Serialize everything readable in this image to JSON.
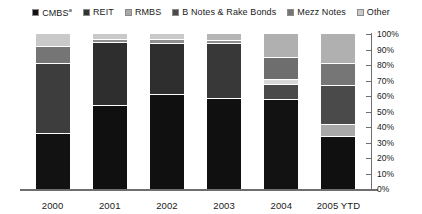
{
  "legend": {
    "position": "top",
    "items": [
      {
        "label": "CMBS",
        "superscript": "a",
        "color": "#121212",
        "name": "cmbs"
      },
      {
        "label": "REIT",
        "superscript": "",
        "color": "#333333",
        "name": "reit"
      },
      {
        "label": "RMBS",
        "superscript": "",
        "color": "#a8a8a8",
        "name": "rmbs"
      },
      {
        "label": "B Notes & Rake Bonds",
        "superscript": "",
        "color": "#4a4a4a",
        "name": "b-notes-rake-bonds"
      },
      {
        "label": "Mezz Notes",
        "superscript": "",
        "color": "#757575",
        "name": "mezz-notes"
      },
      {
        "label": "Other",
        "superscript": "",
        "color": "#c9c9c9",
        "name": "other"
      }
    ]
  },
  "yaxis": {
    "ticks": [
      "100%",
      "90%",
      "80%",
      "70%",
      "60%",
      "50%",
      "40%",
      "30%",
      "20%",
      "10%",
      "0%"
    ],
    "min": 0,
    "max": 100
  },
  "chart_data": {
    "type": "bar",
    "subtype": "stacked-100-percent",
    "title": "",
    "subtitle": "",
    "xlabel": "",
    "ylabel": "",
    "ylim": [
      0,
      100
    ],
    "grid": false,
    "legend_position": "top",
    "axis_position": "right",
    "categories": [
      "2000",
      "2001",
      "2002",
      "2003",
      "2004",
      "2005 YTD"
    ],
    "series": [
      {
        "name": "CMBS",
        "color": "#121212",
        "values": [
          36,
          54,
          61,
          59,
          55,
          34
        ]
      },
      {
        "name": "REIT",
        "color": "#333333",
        "values": [
          0,
          0,
          0,
          0,
          0,
          0
        ]
      },
      {
        "name": "RMBS",
        "color": "#a8a8a8",
        "values": [
          0,
          0,
          0,
          0,
          0,
          8
        ]
      },
      {
        "name": "B Notes & Rake Bonds",
        "color": "#4a4a4a",
        "values": [
          45,
          41,
          33,
          35,
          10,
          25
        ]
      },
      {
        "name": "Mezz Notes",
        "color": "#757575",
        "values": [
          11,
          2,
          3,
          2,
          14,
          14
        ]
      },
      {
        "name": "Other",
        "color": "#c9c9c9",
        "values": [
          8,
          3,
          3,
          4,
          21,
          19
        ]
      }
    ],
    "bars": [
      {
        "category": "2000",
        "name": "bar-2000",
        "segments": [
          {
            "series": "Other",
            "value": 8,
            "color": "#c9c9c9"
          },
          {
            "series": "Mezz Notes",
            "value": 11,
            "color": "#757575"
          },
          {
            "series": "B Notes & Rake Bonds",
            "value": 45,
            "color": "#3d3d3d"
          },
          {
            "series": "CMBS",
            "value": 36,
            "color": "#121212"
          }
        ]
      },
      {
        "category": "2001",
        "name": "bar-2001",
        "segments": [
          {
            "series": "Other",
            "value": 3,
            "color": "#c9c9c9"
          },
          {
            "series": "Mezz Notes",
            "value": 2,
            "color": "#8f8f8f"
          },
          {
            "series": "B Notes & Rake Bonds",
            "value": 41,
            "color": "#2e2e2e"
          },
          {
            "series": "CMBS",
            "value": 54,
            "color": "#101010"
          }
        ]
      },
      {
        "category": "2002",
        "name": "bar-2002",
        "segments": [
          {
            "series": "Other",
            "value": 3,
            "color": "#c9c9c9"
          },
          {
            "series": "Mezz Notes",
            "value": 3,
            "color": "#8f8f8f"
          },
          {
            "series": "B Notes & Rake Bonds",
            "value": 33,
            "color": "#2e2e2e"
          },
          {
            "series": "CMBS",
            "value": 61,
            "color": "#101010"
          }
        ]
      },
      {
        "category": "2003",
        "name": "bar-2003",
        "segments": [
          {
            "series": "Other",
            "value": 4,
            "color": "#b5b5b5"
          },
          {
            "series": "Mezz Notes",
            "value": 2,
            "color": "#8f8f8f"
          },
          {
            "series": "B Notes & Rake Bonds",
            "value": 35,
            "color": "#383838"
          },
          {
            "series": "CMBS",
            "value": 59,
            "color": "#101010"
          }
        ]
      },
      {
        "category": "2004",
        "name": "bar-2004",
        "segments": [
          {
            "series": "Other",
            "value": 15,
            "color": "#b0b0b0"
          },
          {
            "series": "Mezz Notes",
            "value": 14,
            "color": "#6e6e6e"
          },
          {
            "series": "RMBS",
            "value": 3,
            "color": "#d8d8d8"
          },
          {
            "series": "B Notes & Rake Bonds",
            "value": 10,
            "color": "#4a4a4a"
          },
          {
            "series": "CMBS",
            "value": 58,
            "color": "#121212"
          }
        ]
      },
      {
        "category": "2005 YTD",
        "name": "bar-2005-ytd",
        "segments": [
          {
            "series": "Other",
            "value": 19,
            "color": "#b0b0b0"
          },
          {
            "series": "Mezz Notes",
            "value": 14,
            "color": "#767676"
          },
          {
            "series": "B Notes & Rake Bonds",
            "value": 25,
            "color": "#4a4a4a"
          },
          {
            "series": "RMBS",
            "value": 8,
            "color": "#a8a8a8"
          },
          {
            "series": "CMBS",
            "value": 34,
            "color": "#101010"
          }
        ]
      }
    ]
  }
}
